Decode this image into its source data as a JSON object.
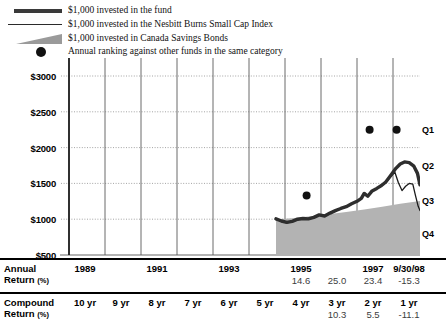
{
  "legend": {
    "items": [
      {
        "icon": "thick-line-swatch",
        "label": "$1,000 invested in the fund"
      },
      {
        "icon": "thin-line-swatch",
        "label": "$1,000 invested in the Nesbitt Burns Small Cap Index"
      },
      {
        "icon": "gray-wedge-swatch",
        "label": "$1,000 invested in Canada Savings Bonds"
      },
      {
        "icon": "black-dot-swatch",
        "label": "Annual ranking against other funds in the same category"
      }
    ]
  },
  "chart_data": {
    "type": "line",
    "title": "",
    "xlabel": "",
    "ylabel": "",
    "ylim": [
      500,
      3000
    ],
    "ytick_labels": [
      "$3000",
      "$2500",
      "$2000",
      "$1500",
      "$1000",
      "$500"
    ],
    "ytick_values": [
      3000,
      2500,
      2000,
      1500,
      1000,
      500
    ],
    "grid": true,
    "xlim": [
      1988.75,
      1998.75
    ],
    "xtick_years": [
      1989,
      1990,
      1991,
      1992,
      1993,
      1994,
      1995,
      1996,
      1997,
      1998
    ],
    "quartile_bands": [
      {
        "label": "Q1",
        "value": 2250
      },
      {
        "label": "Q2",
        "value": 1750
      },
      {
        "label": "Q3",
        "value": 1250
      },
      {
        "label": "Q4",
        "value": 800
      }
    ],
    "series": [
      {
        "name": "$1,000 invested in the fund",
        "style": "thick-line",
        "color": "#2e2e2e",
        "points": [
          [
            1994.75,
            1005
          ],
          [
            1994.9,
            975
          ],
          [
            1995.05,
            955
          ],
          [
            1995.2,
            970
          ],
          [
            1995.35,
            1000
          ],
          [
            1995.5,
            1010
          ],
          [
            1995.65,
            1005
          ],
          [
            1995.8,
            1025
          ],
          [
            1995.95,
            1060
          ],
          [
            1996.1,
            1045
          ],
          [
            1996.25,
            1085
          ],
          [
            1996.4,
            1120
          ],
          [
            1996.55,
            1150
          ],
          [
            1996.7,
            1175
          ],
          [
            1996.85,
            1215
          ],
          [
            1997.0,
            1250
          ],
          [
            1997.12,
            1290
          ],
          [
            1997.2,
            1360
          ],
          [
            1997.3,
            1320
          ],
          [
            1997.42,
            1395
          ],
          [
            1997.55,
            1430
          ],
          [
            1997.68,
            1470
          ],
          [
            1997.8,
            1520
          ],
          [
            1997.95,
            1620
          ],
          [
            1998.08,
            1710
          ],
          [
            1998.2,
            1770
          ],
          [
            1998.32,
            1800
          ],
          [
            1998.45,
            1790
          ],
          [
            1998.58,
            1740
          ],
          [
            1998.68,
            1640
          ],
          [
            1998.75,
            1480
          ]
        ]
      },
      {
        "name": "$1,000 invested in the Nesbitt Burns Small Cap Index",
        "style": "thin-line",
        "color": "#1a1a1a",
        "points": [
          [
            1994.75,
            1000
          ],
          [
            1994.9,
            970
          ],
          [
            1995.05,
            950
          ],
          [
            1995.2,
            965
          ],
          [
            1995.35,
            995
          ],
          [
            1995.5,
            1005
          ],
          [
            1995.65,
            1000
          ],
          [
            1995.8,
            1020
          ],
          [
            1995.95,
            1055
          ],
          [
            1996.1,
            1040
          ],
          [
            1996.25,
            1080
          ],
          [
            1996.4,
            1115
          ],
          [
            1996.55,
            1145
          ],
          [
            1996.7,
            1170
          ],
          [
            1996.85,
            1210
          ],
          [
            1997.0,
            1245
          ],
          [
            1997.12,
            1300
          ],
          [
            1997.2,
            1370
          ],
          [
            1997.3,
            1315
          ],
          [
            1997.42,
            1400
          ],
          [
            1997.55,
            1425
          ],
          [
            1997.68,
            1465
          ],
          [
            1997.8,
            1515
          ],
          [
            1997.95,
            1600
          ],
          [
            1998.05,
            1660
          ],
          [
            1998.15,
            1510
          ],
          [
            1998.25,
            1400
          ],
          [
            1998.35,
            1460
          ],
          [
            1998.45,
            1500
          ],
          [
            1998.55,
            1490
          ],
          [
            1998.62,
            1340
          ],
          [
            1998.7,
            1180
          ],
          [
            1998.75,
            1120
          ]
        ]
      },
      {
        "name": "$1,000 invested in Canada Savings Bonds",
        "style": "filled-area",
        "color": "#b3b3b3",
        "points": [
          [
            1994.75,
            1000
          ],
          [
            1995.2,
            1015
          ],
          [
            1995.7,
            1040
          ],
          [
            1996.2,
            1070
          ],
          [
            1996.7,
            1100
          ],
          [
            1997.2,
            1135
          ],
          [
            1997.7,
            1175
          ],
          [
            1998.2,
            1215
          ],
          [
            1998.75,
            1255
          ]
        ]
      }
    ],
    "annual_ranking_dots": [
      {
        "x": 1995.6,
        "value": 1330,
        "quartile": "Q3"
      },
      {
        "x": 1997.35,
        "value": 2250,
        "quartile": "Q1"
      },
      {
        "x": 1998.1,
        "value": 2250,
        "quartile": "Q1"
      }
    ]
  },
  "table": {
    "annual": {
      "label_line1": "Annual",
      "label_line2": "Return",
      "label_unit": "(%)",
      "headers": [
        "1989",
        "",
        "1991",
        "",
        "1993",
        "",
        "1995",
        "",
        "1997",
        "9/30/98"
      ],
      "values": [
        "",
        "",
        "",
        "",
        "",
        "",
        "14.6",
        "25.0",
        "23.4",
        "-15.3"
      ]
    },
    "compound": {
      "label_line1": "Compound",
      "label_line2": "Return",
      "label_unit": "(%)",
      "headers": [
        "10 yr",
        "9 yr",
        "8 yr",
        "7 yr",
        "6 yr",
        "5 yr",
        "4 yr",
        "3 yr",
        "2 yr",
        "1 yr"
      ],
      "values": [
        "",
        "",
        "",
        "",
        "",
        "",
        "",
        "10.3",
        "5.5",
        "-11.1"
      ]
    }
  }
}
